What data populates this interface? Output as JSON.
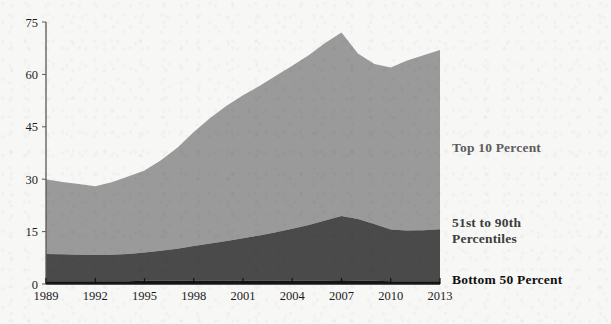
{
  "chart_data": {
    "type": "area",
    "title": "",
    "subtitle": "",
    "xlabel": "",
    "ylabel": "",
    "stacked": true,
    "grid": false,
    "legend_position": "right-inline",
    "xlim": [
      1989,
      2013
    ],
    "ylim": [
      0,
      75
    ],
    "yticks": [
      0,
      15,
      30,
      45,
      60,
      75
    ],
    "xticks": [
      1989,
      1992,
      1995,
      1998,
      2001,
      2004,
      2007,
      2010,
      2013
    ],
    "x": [
      1989,
      1990,
      1991,
      1992,
      1993,
      1994,
      1995,
      1996,
      1997,
      1998,
      1999,
      2000,
      2001,
      2002,
      2003,
      2004,
      2005,
      2006,
      2007,
      2008,
      2009,
      2010,
      2011,
      2012,
      2013
    ],
    "series": [
      {
        "name": "Bottom 50 Percent",
        "color": "#131313",
        "values": [
          0.8,
          0.8,
          0.8,
          0.8,
          0.8,
          0.8,
          0.9,
          0.9,
          0.9,
          1.0,
          1.0,
          1.0,
          1.0,
          1.0,
          1.0,
          1.0,
          1.0,
          1.0,
          1.1,
          1.0,
          0.9,
          0.8,
          0.8,
          0.8,
          0.8
        ]
      },
      {
        "name": "51st to 90th Percentiles",
        "color": "#4a4a4a",
        "values": [
          7.8,
          7.7,
          7.6,
          7.5,
          7.6,
          7.8,
          8.1,
          8.6,
          9.2,
          9.9,
          10.6,
          11.3,
          12.1,
          12.9,
          13.8,
          14.8,
          15.9,
          17.2,
          18.4,
          17.6,
          16.3,
          14.8,
          14.5,
          14.6,
          14.9
        ]
      },
      {
        "name": "Top 10 Percent",
        "color": "#9a9a9a",
        "values": [
          21.4,
          20.7,
          20.2,
          19.7,
          20.7,
          22.2,
          23.5,
          25.9,
          28.9,
          32.6,
          35.9,
          38.7,
          40.9,
          42.8,
          44.8,
          46.7,
          48.6,
          50.8,
          52.5,
          47.4,
          45.8,
          46.4,
          48.7,
          50.1,
          51.3
        ]
      }
    ],
    "series_totals": [
      30.0,
      29.2,
      28.6,
      28.0,
      29.1,
      30.8,
      32.5,
      35.4,
      39.0,
      43.5,
      47.5,
      51.0,
      54.0,
      56.7,
      59.6,
      62.5,
      65.5,
      69.0,
      72.0,
      66.0,
      63.0,
      62.0,
      64.0,
      65.5,
      67.0
    ]
  },
  "axis": {
    "y_tick_labels": [
      "75",
      "60",
      "45",
      "30",
      "15",
      "0"
    ],
    "x_tick_labels": [
      "1989",
      "1992",
      "1995",
      "1998",
      "2001",
      "2004",
      "2007",
      "2010",
      "2013"
    ]
  },
  "legend": {
    "top10": "Top 10 Percent",
    "middle": "51st to 90th\nPercentiles",
    "bottom50": "Bottom 50 Percent"
  },
  "colors": {
    "top10": "#9a9a9a",
    "middle": "#4a4a4a",
    "bottom50": "#131313",
    "axis": "#585858",
    "background": "#f7f7f6",
    "text": "#1c1c1c"
  }
}
